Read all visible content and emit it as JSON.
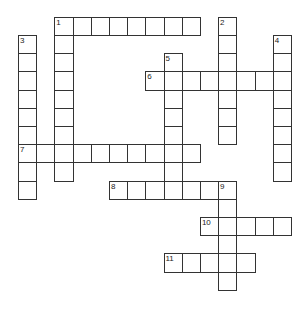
{
  "puzzle": {
    "type": "crossword",
    "origin": [
      18.5,
      17.3
    ],
    "cell_size": 18.2,
    "colors": {
      "border": "#333333",
      "cell": "#ffffff",
      "number": "#222222"
    },
    "entries": [
      {
        "number": "1",
        "direction": "across",
        "row": 0,
        "col": 2,
        "length": 8
      },
      {
        "number": "1",
        "direction": "down",
        "row": 0,
        "col": 2,
        "length": 9
      },
      {
        "number": "2",
        "direction": "down",
        "row": 0,
        "col": 11,
        "length": 7
      },
      {
        "number": "3",
        "direction": "down",
        "row": 1,
        "col": 0,
        "length": 9
      },
      {
        "number": "4",
        "direction": "down",
        "row": 1,
        "col": 14,
        "length": 8
      },
      {
        "number": "5",
        "direction": "down",
        "row": 2,
        "col": 8,
        "length": 8
      },
      {
        "number": "6",
        "direction": "across",
        "row": 3,
        "col": 7,
        "length": 8
      },
      {
        "number": "7",
        "direction": "across",
        "row": 7,
        "col": 0,
        "length": 10
      },
      {
        "number": "8",
        "direction": "across",
        "row": 9,
        "col": 5,
        "length": 7
      },
      {
        "number": "9",
        "direction": "down",
        "row": 9,
        "col": 11,
        "length": 6
      },
      {
        "number": "10",
        "direction": "across",
        "row": 11,
        "col": 10,
        "length": 5
      },
      {
        "number": "11",
        "direction": "across",
        "row": 13,
        "col": 8,
        "length": 5
      }
    ]
  }
}
